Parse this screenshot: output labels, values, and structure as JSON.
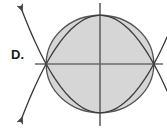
{
  "figure": {
    "label": "D.",
    "background_color": "#ffffff"
  },
  "colors": {
    "axis": "#6b6b6b",
    "curve": "#3d3d3d",
    "ellipse_stroke": "#555555",
    "ellipse_fill": "#d6d6d6",
    "label_text": "#1a1a1a"
  },
  "axes": {
    "x_axis": {
      "name": "x-axis",
      "x_start": 35,
      "x_end": 163,
      "y": 64
    },
    "y_axis": {
      "name": "y-axis",
      "y_start": 3,
      "y_end": 126,
      "x": 100
    },
    "origin": {
      "x": 100,
      "y": 64
    },
    "show_ticks": false,
    "show_labels": false,
    "show_grid": false
  },
  "chart_data": {
    "type": "scatter",
    "title": "",
    "xlabel": "",
    "ylabel": "",
    "xlim": [
      -4.5,
      4.5
    ],
    "ylim": [
      -4.5,
      4.5
    ],
    "grid": false,
    "legend": "none",
    "annotations": [
      "D."
    ],
    "shapes": [
      {
        "name": "ellipse",
        "type": "ellipse",
        "center": [
          0,
          0
        ],
        "semi_axis_x": 2.9,
        "semi_axis_y": 3.4,
        "filled": true,
        "fill": "#d6d6d6",
        "stroke": "#555555"
      },
      {
        "name": "parabola-opening-up",
        "type": "parabola",
        "vertex": [
          0,
          -3.4
        ],
        "opens": "up",
        "passes_through": [
          [
            -2.9,
            0
          ],
          [
            2.9,
            0
          ]
        ],
        "arrowheads": [
          "upper-left",
          "upper-right"
        ],
        "stroke": "#3d3d3d"
      },
      {
        "name": "parabola-opening-down",
        "type": "parabola",
        "vertex": [
          0,
          3.4
        ],
        "opens": "down",
        "passes_through": [
          [
            -2.9,
            0
          ],
          [
            2.9,
            0
          ]
        ],
        "arrowheads": [
          "lower-left",
          "lower-right"
        ],
        "stroke": "#3d3d3d"
      }
    ],
    "intersections": [
      {
        "name": "left-intersection",
        "x": -2.9,
        "y": 0
      },
      {
        "name": "right-intersection",
        "x": 2.9,
        "y": 0
      }
    ]
  }
}
